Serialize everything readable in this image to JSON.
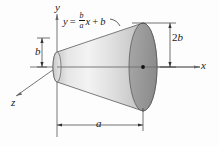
{
  "figure": {
    "background": "#fdfdfd"
  },
  "axes": {
    "x_label": "x",
    "y_label": "y",
    "z_label": "z",
    "axis_color": "#555555"
  },
  "equation": {
    "lhs": "y",
    "equals": "=",
    "frac_numerator": "b",
    "frac_denominator": "a",
    "times_var": "x",
    "plus": "+",
    "intercept": "b"
  },
  "dimensions": {
    "left_radius_label": "b",
    "right_diameter_label_prefix": "2",
    "right_diameter_label_var": "b",
    "axial_length_label": "a"
  },
  "solid": {
    "body_fill_light": "#f0f0f0",
    "body_fill_mid": "#d8d8d8",
    "body_fill_dark": "#c2c2c2",
    "right_face_fill": "#9d9d9d",
    "right_face_fill_dark": "#8a8a8a",
    "left_face_fill": "#e2e2e2",
    "outline": "#4a4a4a",
    "center_dot": "#111111"
  }
}
